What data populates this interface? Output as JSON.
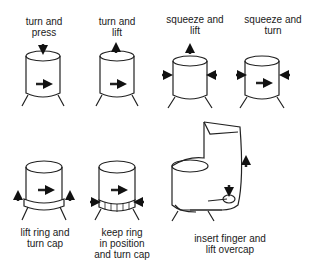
{
  "diagram": {
    "panels": [
      {
        "id": "turn-press",
        "label": "turn and\npress"
      },
      {
        "id": "turn-lift",
        "label": "turn and\nlift"
      },
      {
        "id": "squeeze-lift",
        "label": "squeeze and\nlift"
      },
      {
        "id": "squeeze-turn",
        "label": "squeeze and\nturn"
      },
      {
        "id": "lift-ring",
        "label": "lift ring and\nturn cap"
      },
      {
        "id": "keep-ring",
        "label": "keep ring\nin position\nand turn cap"
      },
      {
        "id": "overcap",
        "label": "insert finger and\nlift overcap"
      }
    ]
  }
}
